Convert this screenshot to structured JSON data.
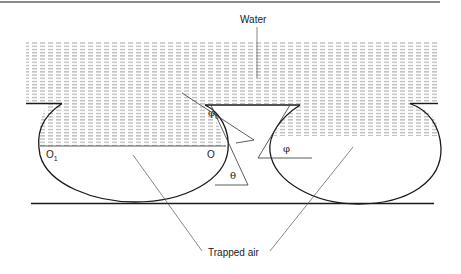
{
  "diagram": {
    "labels": {
      "water": "Water",
      "trapped_air": "Trapped air",
      "o1": "O",
      "o1_sub": "1",
      "o": "O",
      "phi0": "φ",
      "phi0_sub": "0",
      "phi": "φ",
      "theta": "θ"
    },
    "colors": {
      "line": "#1a1a1a",
      "hatch": "#9a9a9a",
      "leader": "#555555"
    }
  }
}
